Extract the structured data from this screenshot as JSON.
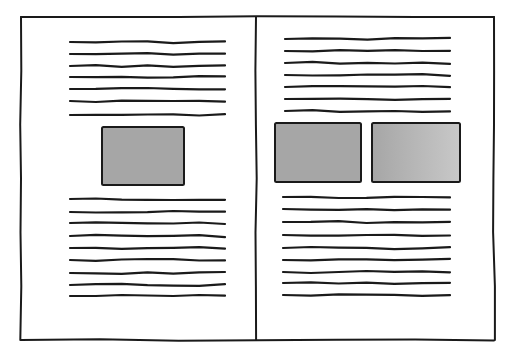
{
  "illustration": {
    "subject": "open book spread layout sketch",
    "colors": {
      "ink": "#1a1a1a",
      "image_fill": "#a6a6a6",
      "image_fill_light": "#bdbdbd",
      "paper": "#ffffff"
    },
    "frame": {
      "x": 21,
      "y": 17,
      "width": 473,
      "height": 323,
      "spine_x": 256
    },
    "left_page": {
      "text_top": {
        "x1": 70,
        "x2": 225,
        "ys": [
          42,
          54,
          66,
          77,
          89,
          101,
          115
        ]
      },
      "image": {
        "x": 102,
        "y": 127,
        "width": 82,
        "height": 58
      },
      "text_bottom": {
        "x1": 70,
        "x2": 225,
        "ys": [
          199,
          212,
          223,
          236,
          248,
          260,
          273,
          285,
          296
        ]
      }
    },
    "right_page": {
      "text_top": {
        "x1": 285,
        "x2": 450,
        "ys": [
          39,
          51,
          63,
          75,
          87,
          99,
          111
        ]
      },
      "images": [
        {
          "x": 275,
          "y": 123,
          "width": 86,
          "height": 59
        },
        {
          "x": 372,
          "y": 123,
          "width": 88,
          "height": 59
        }
      ],
      "text_bottom": {
        "x1": 283,
        "x2": 450,
        "ys": [
          197,
          209,
          222,
          235,
          248,
          260,
          272,
          283,
          295
        ]
      }
    }
  }
}
